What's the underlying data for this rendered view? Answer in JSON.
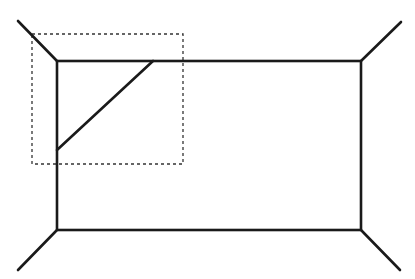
{
  "diagram": {
    "title": "",
    "stroke_color": "#1a1a1a",
    "dash_color": "#333333",
    "main_rectangle": {
      "x1": 57,
      "y1": 61,
      "x2": 361,
      "y2": 230
    },
    "corner_lines": [
      {
        "name": "top-left",
        "x1": 18,
        "y1": 21,
        "x2": 57,
        "y2": 61
      },
      {
        "name": "top-right",
        "x1": 361,
        "y1": 61,
        "x2": 401,
        "y2": 22
      },
      {
        "name": "bottom-left",
        "x1": 57,
        "y1": 230,
        "x2": 18,
        "y2": 270
      },
      {
        "name": "bottom-right",
        "x1": 361,
        "y1": 230,
        "x2": 400,
        "y2": 270
      }
    ],
    "cut_line": {
      "x1": 153,
      "y1": 61,
      "x2": 57,
      "y2": 150
    },
    "highlight_box": {
      "x": 32,
      "y": 34,
      "width": 151,
      "height": 130
    }
  }
}
